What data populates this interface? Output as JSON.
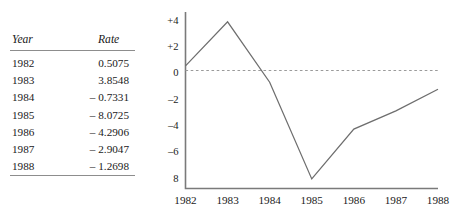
{
  "table": {
    "headers": [
      "Year",
      "Rate"
    ],
    "rows": [
      {
        "year": "1982",
        "rate": "0.5075"
      },
      {
        "year": "1983",
        "rate": "3.8548"
      },
      {
        "year": "1984",
        "rate": "– 0.7331"
      },
      {
        "year": "1985",
        "rate": "– 8.0725"
      },
      {
        "year": "1986",
        "rate": "– 4.2906"
      },
      {
        "year": "1987",
        "rate": "– 2.9047"
      },
      {
        "year": "1988",
        "rate": "– 1.2698"
      }
    ]
  },
  "chart_data": {
    "type": "line",
    "title": "",
    "xlabel": "",
    "ylabel": "",
    "categories": [
      "1982",
      "1983",
      "1984",
      "1985",
      "1986",
      "1987",
      "1988"
    ],
    "values": [
      0.5075,
      3.8548,
      -0.7331,
      -8.0725,
      -4.2906,
      -2.9047,
      -1.2698
    ],
    "series": [
      {
        "name": "Rate",
        "values": [
          0.5075,
          3.8548,
          -0.7331,
          -8.0725,
          -4.2906,
          -2.9047,
          -1.2698
        ]
      }
    ],
    "ylim": [
      -8.8,
      4.6
    ],
    "xlim": [
      "1982",
      "1988"
    ],
    "ytick_values": [
      4,
      2,
      0,
      -2,
      -4,
      -6,
      -8
    ],
    "ytick_labels": [
      "+4",
      "+2",
      "0",
      "–2",
      "–4",
      "–6",
      "8"
    ],
    "xtick_labels": [
      "1982",
      "1983",
      "1984",
      "1985",
      "1986",
      "1987",
      "1988"
    ],
    "grid": false,
    "zero_reference_line": true,
    "legend": "none",
    "line_color": "#6e6e6e",
    "axis_color": "#7a7a7a",
    "zero_line_color": "#9a9a9a"
  }
}
